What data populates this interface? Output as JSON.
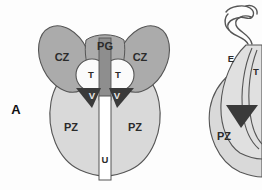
{
  "figure": {
    "panel_label": "A",
    "caption_visible": false,
    "view_left": "coronal",
    "view_right": "sagittal-cropped",
    "background_color": "#fdfdfd"
  },
  "palette": {
    "peripheral_zone": "#d9d9d9",
    "central_zone": "#ababab",
    "periurethral_column": "#8e8e8e",
    "transition_zone": "#fbfbfb",
    "verumontanum": "#3a3a3a",
    "urethra": "#ffffff",
    "outline": "#555555",
    "label_dark": "#2b2b2b",
    "label_light": "#e8e8e8"
  },
  "left_figure": {
    "name": "coronal-prostate-section",
    "labels": [
      {
        "key": "cz_left",
        "text": "CZ",
        "x": 62,
        "y": 58,
        "style": "zone",
        "zone": "central-zone"
      },
      {
        "key": "cz_right",
        "text": "CZ",
        "x": 140,
        "y": 58,
        "style": "zone",
        "zone": "central-zone"
      },
      {
        "key": "pg",
        "text": "PG",
        "x": 103,
        "y": 48,
        "style": "zone",
        "zone": "periurethral-glands"
      },
      {
        "key": "t_left",
        "text": "T",
        "x": 91,
        "y": 75,
        "style": "small",
        "zone": "transition-zone"
      },
      {
        "key": "t_right",
        "text": "T",
        "x": 118,
        "y": 75,
        "style": "small",
        "zone": "transition-zone"
      },
      {
        "key": "v_left",
        "text": "V",
        "x": 92,
        "y": 97,
        "style": "onkdark",
        "zone": "verumontanum"
      },
      {
        "key": "v_right",
        "text": "V",
        "x": 117,
        "y": 97,
        "style": "onkdark",
        "zone": "verumontanum"
      },
      {
        "key": "pz_left",
        "text": "PZ",
        "x": 71,
        "y": 128,
        "style": "zone",
        "zone": "peripheral-zone"
      },
      {
        "key": "pz_right",
        "text": "PZ",
        "x": 135,
        "y": 128,
        "style": "zone",
        "zone": "peripheral-zone"
      },
      {
        "key": "u",
        "text": "U",
        "x": 104,
        "y": 160,
        "style": "small",
        "zone": "urethra"
      }
    ]
  },
  "right_figure": {
    "name": "sagittal-prostate-section-cropped",
    "labels": [
      {
        "key": "e",
        "text": "E",
        "x": 231,
        "y": 59,
        "style": "small",
        "zone": "ejaculatory-duct"
      },
      {
        "key": "t",
        "text": "T",
        "x": 256,
        "y": 72,
        "style": "small",
        "zone": "transition-zone"
      },
      {
        "key": "pz",
        "text": "PZ",
        "x": 224,
        "y": 137,
        "style": "zone",
        "zone": "peripheral-zone"
      }
    ]
  },
  "legend_keys": {
    "CZ": "central zone",
    "PZ": "peripheral zone",
    "T": "transition zone",
    "PG": "periurethral glands",
    "V": "verumontanum",
    "U": "urethra",
    "E": "ejaculatory duct"
  }
}
